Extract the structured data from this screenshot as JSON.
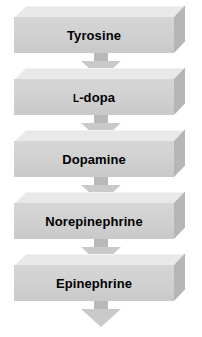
{
  "diagram": {
    "type": "flow-chart",
    "orientation": "vertical",
    "colors": {
      "box_front": "#d2d2d2",
      "box_top": "#e9e9e9",
      "box_side": "#b6b6b6",
      "arrow": "#c9c9c9",
      "arrow_stem": "#b9b9b9",
      "label_text": "#000000",
      "background": "#ffffff"
    },
    "steps": [
      {
        "label": "Tyrosine",
        "label_prefix": "",
        "label_rest": "Tyrosine"
      },
      {
        "label": "L-dopa",
        "label_prefix": "L",
        "label_rest": "-dopa"
      },
      {
        "label": "Dopamine",
        "label_prefix": "",
        "label_rest": "Dopamine"
      },
      {
        "label": "Norepinephrine",
        "label_prefix": "",
        "label_rest": "Norepinephrine"
      },
      {
        "label": "Epinephrine",
        "label_prefix": "",
        "label_rest": "Epinephrine"
      }
    ],
    "arrows": [
      {
        "name": "tyrosine-to-ldopa",
        "direction": "down"
      },
      {
        "name": "ldopa-to-dopamine",
        "direction": "down"
      },
      {
        "name": "dopamine-to-norepinephrine",
        "direction": "down"
      },
      {
        "name": "norepinephrine-to-epinephrine",
        "direction": "down"
      },
      {
        "name": "epinephrine-outflow",
        "direction": "down"
      }
    ]
  }
}
